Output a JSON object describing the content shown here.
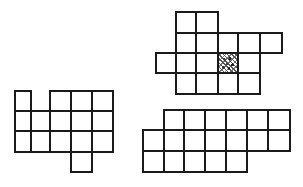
{
  "diagram": {
    "line_color": "#1a1a1a",
    "background": "#ffffff",
    "shapes": [
      {
        "name": "top-right-shape",
        "cols_x": [
          156,
          176,
          196,
          218,
          238,
          260,
          282
        ],
        "rows_y": [
          12,
          33,
          53,
          73,
          94
        ],
        "cells": [
          {
            "r": 0,
            "c": 1
          },
          {
            "r": 0,
            "c": 2
          },
          {
            "r": 1,
            "c": 1
          },
          {
            "r": 1,
            "c": 2
          },
          {
            "r": 1,
            "c": 3
          },
          {
            "r": 1,
            "c": 4
          },
          {
            "r": 1,
            "c": 5
          },
          {
            "r": 2,
            "c": 0
          },
          {
            "r": 2,
            "c": 1
          },
          {
            "r": 2,
            "c": 2
          },
          {
            "r": 2,
            "c": 3,
            "marked": true
          },
          {
            "r": 2,
            "c": 4
          },
          {
            "r": 3,
            "c": 1
          },
          {
            "r": 3,
            "c": 2
          },
          {
            "r": 3,
            "c": 3
          },
          {
            "r": 3,
            "c": 4
          }
        ]
      },
      {
        "name": "bottom-left-shape",
        "cols_x": [
          15,
          31,
          50,
          71,
          92,
          113
        ],
        "rows_y": [
          91,
          111,
          131,
          152,
          172
        ],
        "cells": [
          {
            "r": 0,
            "c": 0
          },
          {
            "r": 0,
            "c": 2
          },
          {
            "r": 0,
            "c": 3
          },
          {
            "r": 0,
            "c": 4
          },
          {
            "r": 1,
            "c": 0
          },
          {
            "r": 1,
            "c": 1
          },
          {
            "r": 1,
            "c": 2
          },
          {
            "r": 1,
            "c": 3
          },
          {
            "r": 1,
            "c": 4
          },
          {
            "r": 2,
            "c": 0
          },
          {
            "r": 2,
            "c": 1
          },
          {
            "r": 2,
            "c": 2
          },
          {
            "r": 2,
            "c": 3
          },
          {
            "r": 2,
            "c": 4
          },
          {
            "r": 3,
            "c": 3
          }
        ]
      },
      {
        "name": "bottom-right-shape",
        "cols_x": [
          143,
          164,
          184,
          205,
          226,
          247,
          268,
          290
        ],
        "rows_y": [
          110,
          130,
          151,
          172
        ],
        "cells": [
          {
            "r": 0,
            "c": 1
          },
          {
            "r": 0,
            "c": 2
          },
          {
            "r": 0,
            "c": 3
          },
          {
            "r": 0,
            "c": 4
          },
          {
            "r": 0,
            "c": 5
          },
          {
            "r": 0,
            "c": 6
          },
          {
            "r": 1,
            "c": 0
          },
          {
            "r": 1,
            "c": 1
          },
          {
            "r": 1,
            "c": 2
          },
          {
            "r": 1,
            "c": 3
          },
          {
            "r": 1,
            "c": 4
          },
          {
            "r": 1,
            "c": 5
          },
          {
            "r": 1,
            "c": 6
          },
          {
            "r": 2,
            "c": 0
          },
          {
            "r": 2,
            "c": 1
          },
          {
            "r": 2,
            "c": 2
          },
          {
            "r": 2,
            "c": 3
          },
          {
            "r": 2,
            "c": 4
          }
        ]
      }
    ]
  }
}
